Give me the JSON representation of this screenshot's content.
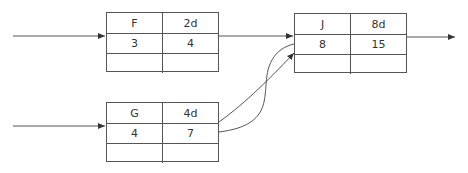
{
  "nodes": {
    "F": {
      "name": "F",
      "duration": "2d",
      "early_start": "3",
      "early_finish": "4",
      "late_start": "",
      "late_finish": ""
    },
    "G": {
      "name": "G",
      "duration": "4d",
      "early_start": "4",
      "early_finish": "7",
      "late_start": "",
      "late_finish": ""
    },
    "J": {
      "name": "J",
      "duration": "8d",
      "early_start": "8",
      "early_finish": "15",
      "late_start": "",
      "late_finish": ""
    }
  },
  "edges": [
    {
      "from": "start",
      "to": "F"
    },
    {
      "from": "start",
      "to": "G"
    },
    {
      "from": "F",
      "to": "J"
    },
    {
      "from": "G",
      "to": "J"
    },
    {
      "from": "G",
      "to": "J"
    },
    {
      "from": "J",
      "to": "end"
    }
  ],
  "colors": {
    "line": "#555555",
    "text": "#333333"
  }
}
